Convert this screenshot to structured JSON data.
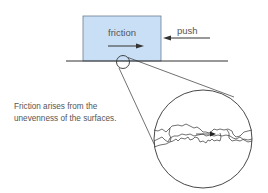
{
  "diagram": {
    "type": "physics-friction",
    "labels": {
      "friction": "friction",
      "push": "push"
    },
    "caption": {
      "line1": "Friction arises from the",
      "line2": "unevenness of the surfaces."
    },
    "colors": {
      "block_fill": "#c9dff5",
      "block_stroke": "#6b7d90",
      "line": "#333333",
      "text": "#555555"
    }
  }
}
